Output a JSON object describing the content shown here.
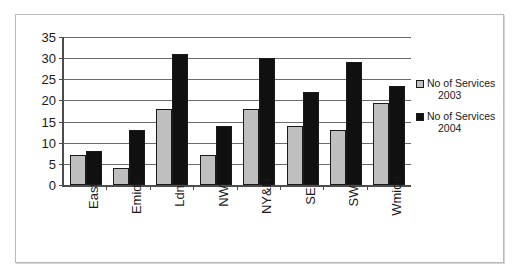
{
  "chart_data": {
    "type": "bar",
    "title": "",
    "xlabel": "",
    "ylabel": "",
    "categories": [
      "East",
      "Emids",
      "Ldn",
      "NW",
      "NY&H",
      "SE",
      "SW",
      "Wmids"
    ],
    "series": [
      {
        "name": "No of Services",
        "year": "2003",
        "color": "#bfbfbf",
        "values": [
          7,
          4,
          18,
          7,
          18,
          14,
          13,
          19.5
        ]
      },
      {
        "name": "No of Services",
        "year": "2004",
        "color": "#101010",
        "values": [
          8,
          13,
          31,
          14,
          30,
          22,
          29,
          23.5
        ]
      }
    ],
    "ylim": [
      0,
      35
    ],
    "ytick_step": 5,
    "yticks": [
      "0",
      "5",
      "10",
      "15",
      "20",
      "25",
      "30",
      "35"
    ],
    "grid": true,
    "legend_position": "right"
  },
  "legend": {
    "entries": [
      {
        "label": "No of Services",
        "year": "2003"
      },
      {
        "label": "No of Services",
        "year": "2004"
      }
    ]
  }
}
